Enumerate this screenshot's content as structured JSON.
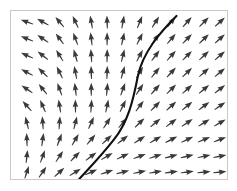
{
  "figure": {
    "name": "vector-field-plot",
    "type": "quiver",
    "background_color": "#ffffff",
    "frame_color": "#c9c9c9",
    "arrow_color": "#3a3a3a",
    "curve_color": "#101010",
    "frame": {
      "x": 10,
      "y": 10,
      "width": 218,
      "height": 170
    }
  },
  "chart_data": {
    "type": "scatter",
    "title": "",
    "xlabel": "",
    "ylabel": "",
    "grid": false,
    "legend": null,
    "xlim": [
      0,
      218
    ],
    "ylim": [
      0,
      170
    ],
    "grid_layout": {
      "columns": 13,
      "rows": 10,
      "x_start": 16,
      "y_start": 11,
      "x_step": 16.2,
      "y_step": 17.2
    },
    "arrow_length": 13,
    "arrows": [
      {
        "col": 0,
        "row": 0,
        "x": 16,
        "y": 11,
        "angle_deg": 160
      },
      {
        "col": 1,
        "row": 0,
        "x": 32,
        "y": 11,
        "angle_deg": 150
      },
      {
        "col": 2,
        "row": 0,
        "x": 49,
        "y": 11,
        "angle_deg": 130
      },
      {
        "col": 3,
        "row": 0,
        "x": 65,
        "y": 11,
        "angle_deg": 115
      },
      {
        "col": 4,
        "row": 0,
        "x": 81,
        "y": 11,
        "angle_deg": 100
      },
      {
        "col": 5,
        "row": 0,
        "x": 97,
        "y": 11,
        "angle_deg": 92
      },
      {
        "col": 6,
        "row": 0,
        "x": 113,
        "y": 11,
        "angle_deg": 80
      },
      {
        "col": 7,
        "row": 0,
        "x": 130,
        "y": 11,
        "angle_deg": 68
      },
      {
        "col": 8,
        "row": 0,
        "x": 146,
        "y": 11,
        "angle_deg": 58
      },
      {
        "col": 9,
        "row": 0,
        "x": 162,
        "y": 11,
        "angle_deg": 52
      },
      {
        "col": 10,
        "row": 0,
        "x": 178,
        "y": 11,
        "angle_deg": 48
      },
      {
        "col": 11,
        "row": 0,
        "x": 195,
        "y": 11,
        "angle_deg": 45
      },
      {
        "col": 12,
        "row": 0,
        "x": 211,
        "y": 11,
        "angle_deg": 42
      },
      {
        "col": 0,
        "row": 1,
        "x": 16,
        "y": 28,
        "angle_deg": 158
      },
      {
        "col": 1,
        "row": 1,
        "x": 32,
        "y": 28,
        "angle_deg": 146
      },
      {
        "col": 2,
        "row": 1,
        "x": 49,
        "y": 28,
        "angle_deg": 126
      },
      {
        "col": 3,
        "row": 1,
        "x": 65,
        "y": 28,
        "angle_deg": 110
      },
      {
        "col": 4,
        "row": 1,
        "x": 81,
        "y": 28,
        "angle_deg": 97
      },
      {
        "col": 5,
        "row": 1,
        "x": 97,
        "y": 28,
        "angle_deg": 90
      },
      {
        "col": 6,
        "row": 1,
        "x": 113,
        "y": 28,
        "angle_deg": 78
      },
      {
        "col": 7,
        "row": 1,
        "x": 130,
        "y": 28,
        "angle_deg": 64
      },
      {
        "col": 8,
        "row": 1,
        "x": 146,
        "y": 28,
        "angle_deg": 55
      },
      {
        "col": 9,
        "row": 1,
        "x": 162,
        "y": 28,
        "angle_deg": 50
      },
      {
        "col": 10,
        "row": 1,
        "x": 178,
        "y": 28,
        "angle_deg": 46
      },
      {
        "col": 11,
        "row": 1,
        "x": 195,
        "y": 28,
        "angle_deg": 44
      },
      {
        "col": 12,
        "row": 1,
        "x": 211,
        "y": 28,
        "angle_deg": 42
      },
      {
        "col": 0,
        "row": 2,
        "x": 16,
        "y": 45,
        "angle_deg": 156
      },
      {
        "col": 1,
        "row": 2,
        "x": 32,
        "y": 45,
        "angle_deg": 142
      },
      {
        "col": 2,
        "row": 2,
        "x": 49,
        "y": 45,
        "angle_deg": 122
      },
      {
        "col": 3,
        "row": 2,
        "x": 65,
        "y": 45,
        "angle_deg": 106
      },
      {
        "col": 4,
        "row": 2,
        "x": 81,
        "y": 45,
        "angle_deg": 94
      },
      {
        "col": 5,
        "row": 2,
        "x": 97,
        "y": 45,
        "angle_deg": 89
      },
      {
        "col": 6,
        "row": 2,
        "x": 113,
        "y": 45,
        "angle_deg": 76
      },
      {
        "col": 7,
        "row": 2,
        "x": 130,
        "y": 45,
        "angle_deg": 62
      },
      {
        "col": 8,
        "row": 2,
        "x": 146,
        "y": 45,
        "angle_deg": 53
      },
      {
        "col": 9,
        "row": 2,
        "x": 162,
        "y": 45,
        "angle_deg": 48
      },
      {
        "col": 10,
        "row": 2,
        "x": 178,
        "y": 45,
        "angle_deg": 45
      },
      {
        "col": 11,
        "row": 2,
        "x": 195,
        "y": 45,
        "angle_deg": 43
      },
      {
        "col": 12,
        "row": 2,
        "x": 211,
        "y": 45,
        "angle_deg": 41
      },
      {
        "col": 0,
        "row": 3,
        "x": 16,
        "y": 62,
        "angle_deg": 152
      },
      {
        "col": 1,
        "row": 3,
        "x": 32,
        "y": 62,
        "angle_deg": 136
      },
      {
        "col": 2,
        "row": 3,
        "x": 49,
        "y": 62,
        "angle_deg": 116
      },
      {
        "col": 3,
        "row": 3,
        "x": 65,
        "y": 62,
        "angle_deg": 101
      },
      {
        "col": 4,
        "row": 3,
        "x": 81,
        "y": 62,
        "angle_deg": 92
      },
      {
        "col": 5,
        "row": 3,
        "x": 97,
        "y": 62,
        "angle_deg": 88
      },
      {
        "col": 6,
        "row": 3,
        "x": 113,
        "y": 62,
        "angle_deg": 74
      },
      {
        "col": 7,
        "row": 3,
        "x": 130,
        "y": 62,
        "angle_deg": 60
      },
      {
        "col": 8,
        "row": 3,
        "x": 146,
        "y": 62,
        "angle_deg": 51
      },
      {
        "col": 9,
        "row": 3,
        "x": 162,
        "y": 62,
        "angle_deg": 47
      },
      {
        "col": 10,
        "row": 3,
        "x": 178,
        "y": 62,
        "angle_deg": 44
      },
      {
        "col": 11,
        "row": 3,
        "x": 195,
        "y": 62,
        "angle_deg": 42
      },
      {
        "col": 12,
        "row": 3,
        "x": 211,
        "y": 62,
        "angle_deg": 40
      },
      {
        "col": 0,
        "row": 4,
        "x": 16,
        "y": 79,
        "angle_deg": 146
      },
      {
        "col": 1,
        "row": 4,
        "x": 32,
        "y": 79,
        "angle_deg": 128
      },
      {
        "col": 2,
        "row": 4,
        "x": 49,
        "y": 79,
        "angle_deg": 110
      },
      {
        "col": 3,
        "row": 4,
        "x": 65,
        "y": 79,
        "angle_deg": 97
      },
      {
        "col": 4,
        "row": 4,
        "x": 81,
        "y": 79,
        "angle_deg": 90
      },
      {
        "col": 5,
        "row": 4,
        "x": 97,
        "y": 79,
        "angle_deg": 85
      },
      {
        "col": 6,
        "row": 4,
        "x": 113,
        "y": 79,
        "angle_deg": 70
      },
      {
        "col": 7,
        "row": 4,
        "x": 130,
        "y": 79,
        "angle_deg": 57
      },
      {
        "col": 8,
        "row": 4,
        "x": 146,
        "y": 79,
        "angle_deg": 49
      },
      {
        "col": 9,
        "row": 4,
        "x": 162,
        "y": 79,
        "angle_deg": 45
      },
      {
        "col": 10,
        "row": 4,
        "x": 178,
        "y": 79,
        "angle_deg": 42
      },
      {
        "col": 11,
        "row": 4,
        "x": 195,
        "y": 79,
        "angle_deg": 40
      },
      {
        "col": 12,
        "row": 4,
        "x": 211,
        "y": 79,
        "angle_deg": 38
      },
      {
        "col": 0,
        "row": 5,
        "x": 16,
        "y": 96,
        "angle_deg": 132
      },
      {
        "col": 1,
        "row": 5,
        "x": 32,
        "y": 96,
        "angle_deg": 114
      },
      {
        "col": 2,
        "row": 5,
        "x": 49,
        "y": 96,
        "angle_deg": 99
      },
      {
        "col": 3,
        "row": 5,
        "x": 65,
        "y": 96,
        "angle_deg": 91
      },
      {
        "col": 4,
        "row": 5,
        "x": 81,
        "y": 96,
        "angle_deg": 86
      },
      {
        "col": 5,
        "row": 5,
        "x": 97,
        "y": 96,
        "angle_deg": 78
      },
      {
        "col": 6,
        "row": 5,
        "x": 113,
        "y": 96,
        "angle_deg": 64
      },
      {
        "col": 7,
        "row": 5,
        "x": 130,
        "y": 96,
        "angle_deg": 53
      },
      {
        "col": 8,
        "row": 5,
        "x": 146,
        "y": 96,
        "angle_deg": 46
      },
      {
        "col": 9,
        "row": 5,
        "x": 162,
        "y": 96,
        "angle_deg": 42
      },
      {
        "col": 10,
        "row": 5,
        "x": 178,
        "y": 96,
        "angle_deg": 39
      },
      {
        "col": 11,
        "row": 5,
        "x": 195,
        "y": 96,
        "angle_deg": 37
      },
      {
        "col": 12,
        "row": 5,
        "x": 211,
        "y": 96,
        "angle_deg": 35
      },
      {
        "col": 0,
        "row": 6,
        "x": 16,
        "y": 113,
        "angle_deg": 104
      },
      {
        "col": 1,
        "row": 6,
        "x": 32,
        "y": 113,
        "angle_deg": 94
      },
      {
        "col": 2,
        "row": 6,
        "x": 49,
        "y": 113,
        "angle_deg": 86
      },
      {
        "col": 3,
        "row": 6,
        "x": 65,
        "y": 113,
        "angle_deg": 76
      },
      {
        "col": 4,
        "row": 6,
        "x": 81,
        "y": 113,
        "angle_deg": 66
      },
      {
        "col": 5,
        "row": 6,
        "x": 97,
        "y": 113,
        "angle_deg": 57
      },
      {
        "col": 6,
        "row": 6,
        "x": 113,
        "y": 113,
        "angle_deg": 50
      },
      {
        "col": 7,
        "row": 6,
        "x": 130,
        "y": 113,
        "angle_deg": 44
      },
      {
        "col": 8,
        "row": 6,
        "x": 146,
        "y": 113,
        "angle_deg": 40
      },
      {
        "col": 9,
        "row": 6,
        "x": 162,
        "y": 113,
        "angle_deg": 37
      },
      {
        "col": 10,
        "row": 6,
        "x": 178,
        "y": 113,
        "angle_deg": 34
      },
      {
        "col": 11,
        "row": 6,
        "x": 195,
        "y": 113,
        "angle_deg": 32
      },
      {
        "col": 12,
        "row": 6,
        "x": 211,
        "y": 113,
        "angle_deg": 30
      },
      {
        "col": 0,
        "row": 7,
        "x": 16,
        "y": 130,
        "angle_deg": 92
      },
      {
        "col": 1,
        "row": 7,
        "x": 32,
        "y": 130,
        "angle_deg": 82
      },
      {
        "col": 2,
        "row": 7,
        "x": 49,
        "y": 130,
        "angle_deg": 70
      },
      {
        "col": 3,
        "row": 7,
        "x": 65,
        "y": 130,
        "angle_deg": 60
      },
      {
        "col": 4,
        "row": 7,
        "x": 81,
        "y": 130,
        "angle_deg": 50
      },
      {
        "col": 5,
        "row": 7,
        "x": 97,
        "y": 130,
        "angle_deg": 43
      },
      {
        "col": 6,
        "row": 7,
        "x": 113,
        "y": 130,
        "angle_deg": 38
      },
      {
        "col": 7,
        "row": 7,
        "x": 130,
        "y": 130,
        "angle_deg": 34
      },
      {
        "col": 8,
        "row": 7,
        "x": 146,
        "y": 130,
        "angle_deg": 30
      },
      {
        "col": 9,
        "row": 7,
        "x": 162,
        "y": 130,
        "angle_deg": 27
      },
      {
        "col": 10,
        "row": 7,
        "x": 178,
        "y": 130,
        "angle_deg": 25
      },
      {
        "col": 11,
        "row": 7,
        "x": 195,
        "y": 130,
        "angle_deg": 23
      },
      {
        "col": 12,
        "row": 7,
        "x": 211,
        "y": 130,
        "angle_deg": 21
      },
      {
        "col": 0,
        "row": 8,
        "x": 16,
        "y": 147,
        "angle_deg": 84
      },
      {
        "col": 1,
        "row": 8,
        "x": 32,
        "y": 147,
        "angle_deg": 70
      },
      {
        "col": 2,
        "row": 8,
        "x": 49,
        "y": 147,
        "angle_deg": 57
      },
      {
        "col": 3,
        "row": 8,
        "x": 65,
        "y": 147,
        "angle_deg": 46
      },
      {
        "col": 4,
        "row": 8,
        "x": 81,
        "y": 147,
        "angle_deg": 37
      },
      {
        "col": 5,
        "row": 8,
        "x": 97,
        "y": 147,
        "angle_deg": 30
      },
      {
        "col": 6,
        "row": 8,
        "x": 113,
        "y": 147,
        "angle_deg": 25
      },
      {
        "col": 7,
        "row": 8,
        "x": 130,
        "y": 147,
        "angle_deg": 21
      },
      {
        "col": 8,
        "row": 8,
        "x": 146,
        "y": 147,
        "angle_deg": 18
      },
      {
        "col": 9,
        "row": 8,
        "x": 162,
        "y": 147,
        "angle_deg": 15
      },
      {
        "col": 10,
        "row": 8,
        "x": 178,
        "y": 147,
        "angle_deg": 13
      },
      {
        "col": 11,
        "row": 8,
        "x": 195,
        "y": 147,
        "angle_deg": 12
      },
      {
        "col": 12,
        "row": 8,
        "x": 211,
        "y": 147,
        "angle_deg": 11
      },
      {
        "col": 0,
        "row": 9,
        "x": 16,
        "y": 163,
        "angle_deg": 72
      },
      {
        "col": 1,
        "row": 9,
        "x": 32,
        "y": 163,
        "angle_deg": 56
      },
      {
        "col": 2,
        "row": 9,
        "x": 49,
        "y": 163,
        "angle_deg": 42
      },
      {
        "col": 3,
        "row": 9,
        "x": 65,
        "y": 163,
        "angle_deg": 32
      },
      {
        "col": 4,
        "row": 9,
        "x": 81,
        "y": 163,
        "angle_deg": 24
      },
      {
        "col": 5,
        "row": 9,
        "x": 97,
        "y": 163,
        "angle_deg": 18
      },
      {
        "col": 6,
        "row": 9,
        "x": 113,
        "y": 163,
        "angle_deg": 14
      },
      {
        "col": 7,
        "row": 9,
        "x": 130,
        "y": 163,
        "angle_deg": 11
      },
      {
        "col": 8,
        "row": 9,
        "x": 146,
        "y": 163,
        "angle_deg": 9
      },
      {
        "col": 9,
        "row": 9,
        "x": 162,
        "y": 163,
        "angle_deg": 8
      },
      {
        "col": 10,
        "row": 9,
        "x": 178,
        "y": 163,
        "angle_deg": 7
      },
      {
        "col": 11,
        "row": 9,
        "x": 195,
        "y": 163,
        "angle_deg": 6
      },
      {
        "col": 12,
        "row": 9,
        "x": 211,
        "y": 163,
        "angle_deg": 6
      }
    ],
    "curves": [
      {
        "name": "separatrix",
        "color": "#101010",
        "width": 2.1,
        "path": "M 167 5 C 150 22, 133 42, 128 66 C 123 92, 118 112, 104 130 C 90 148, 78 160, 68 171"
      }
    ]
  }
}
